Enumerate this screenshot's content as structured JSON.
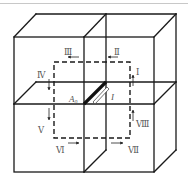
{
  "figure": {
    "colors": {
      "edge": "#1a1a1a",
      "loop": "#1a1a1a",
      "label": "#555555",
      "top_rule": "#c8c8c8"
    },
    "wire": {
      "label": "A₀",
      "current_label": "I"
    },
    "segments": [
      {
        "id": "I",
        "label": "Ⅰ",
        "arrow": "up"
      },
      {
        "id": "II",
        "label": "Ⅱ",
        "arrow": "left"
      },
      {
        "id": "III",
        "label": "Ⅲ",
        "arrow": "left"
      },
      {
        "id": "IV",
        "label": "Ⅳ",
        "arrow": "down"
      },
      {
        "id": "V",
        "label": "Ⅴ",
        "arrow": "down"
      },
      {
        "id": "VI",
        "label": "Ⅵ",
        "arrow": "right"
      },
      {
        "id": "VII",
        "label": "Ⅶ",
        "arrow": "right"
      },
      {
        "id": "VIII",
        "label": "Ⅷ",
        "arrow": "up"
      }
    ]
  }
}
